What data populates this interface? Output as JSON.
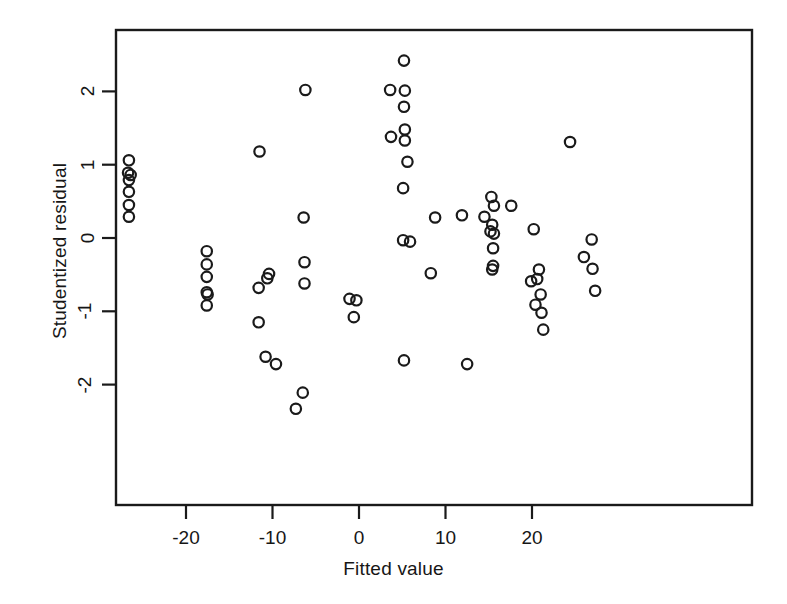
{
  "figure": {
    "background": "#ffffff",
    "ink_color": "#1a1a1a",
    "marker": "open-circle"
  },
  "chart_data": {
    "type": "scatter",
    "title": "",
    "xlabel": "Fitted value",
    "ylabel": "Studentized residual",
    "xlim": [
      -28.1,
      -28.1
    ],
    "x_axis_range": [
      -28.1,
      45.4
    ],
    "ylim": [
      -2.5,
      2.7
    ],
    "xticks": [
      -20,
      -10,
      0,
      10,
      20
    ],
    "xtick_labels": [
      "-20",
      "-10",
      "0",
      "10",
      "20"
    ],
    "yticks": [
      -2,
      -1,
      0,
      1,
      2
    ],
    "ytick_labels": [
      "-2",
      "-1",
      "0",
      "1",
      "2"
    ],
    "grid": false,
    "legend": null,
    "marker_style": "open circle",
    "n_points": 73,
    "points": [
      {
        "x": -26.6,
        "y": 1.06
      },
      {
        "x": -26.7,
        "y": 0.89
      },
      {
        "x": -26.4,
        "y": 0.86
      },
      {
        "x": -26.6,
        "y": 0.79
      },
      {
        "x": -26.6,
        "y": 0.63
      },
      {
        "x": -26.6,
        "y": 0.45
      },
      {
        "x": -26.6,
        "y": 0.29
      },
      {
        "x": -17.6,
        "y": -0.18
      },
      {
        "x": -17.6,
        "y": -0.36
      },
      {
        "x": -17.6,
        "y": -0.53
      },
      {
        "x": -17.6,
        "y": -0.74
      },
      {
        "x": -17.5,
        "y": -0.77
      },
      {
        "x": -17.6,
        "y": -0.92
      },
      {
        "x": -11.5,
        "y": 1.18
      },
      {
        "x": -11.6,
        "y": -0.68
      },
      {
        "x": -11.6,
        "y": -1.15
      },
      {
        "x": -10.6,
        "y": -0.55
      },
      {
        "x": -10.4,
        "y": -0.49
      },
      {
        "x": -10.8,
        "y": -1.62
      },
      {
        "x": -9.6,
        "y": -1.72
      },
      {
        "x": -7.3,
        "y": -2.33
      },
      {
        "x": -6.2,
        "y": 2.02
      },
      {
        "x": -6.4,
        "y": 0.28
      },
      {
        "x": -6.3,
        "y": -0.33
      },
      {
        "x": -6.3,
        "y": -0.62
      },
      {
        "x": -6.5,
        "y": -2.11
      },
      {
        "x": -1.1,
        "y": -0.83
      },
      {
        "x": -0.3,
        "y": -0.85
      },
      {
        "x": -0.6,
        "y": -1.08
      },
      {
        "x": 3.6,
        "y": 2.02
      },
      {
        "x": 3.7,
        "y": 1.38
      },
      {
        "x": 5.2,
        "y": 2.42
      },
      {
        "x": 5.3,
        "y": 2.01
      },
      {
        "x": 5.2,
        "y": 1.79
      },
      {
        "x": 5.3,
        "y": 1.48
      },
      {
        "x": 5.3,
        "y": 1.33
      },
      {
        "x": 5.6,
        "y": 1.04
      },
      {
        "x": 5.1,
        "y": 0.68
      },
      {
        "x": 5.1,
        "y": -0.03
      },
      {
        "x": 5.9,
        "y": -0.05
      },
      {
        "x": 5.2,
        "y": -1.67
      },
      {
        "x": 8.8,
        "y": 0.28
      },
      {
        "x": 8.3,
        "y": -0.48
      },
      {
        "x": 11.9,
        "y": 0.31
      },
      {
        "x": 12.5,
        "y": -1.72
      },
      {
        "x": 14.5,
        "y": 0.29
      },
      {
        "x": 15.3,
        "y": 0.56
      },
      {
        "x": 15.6,
        "y": 0.44
      },
      {
        "x": 15.4,
        "y": 0.18
      },
      {
        "x": 15.2,
        "y": 0.09
      },
      {
        "x": 15.6,
        "y": 0.06
      },
      {
        "x": 15.5,
        "y": -0.14
      },
      {
        "x": 15.5,
        "y": -0.38
      },
      {
        "x": 15.4,
        "y": -0.43
      },
      {
        "x": 17.6,
        "y": 0.44
      },
      {
        "x": 20.2,
        "y": 0.12
      },
      {
        "x": 20.8,
        "y": -0.43
      },
      {
        "x": 19.9,
        "y": -0.59
      },
      {
        "x": 20.6,
        "y": -0.56
      },
      {
        "x": 21.0,
        "y": -0.77
      },
      {
        "x": 20.4,
        "y": -0.91
      },
      {
        "x": 21.1,
        "y": -1.02
      },
      {
        "x": 21.3,
        "y": -1.25
      },
      {
        "x": 24.4,
        "y": 1.31
      },
      {
        "x": 26.9,
        "y": -0.02
      },
      {
        "x": 26.0,
        "y": -0.26
      },
      {
        "x": 27.0,
        "y": -0.42
      },
      {
        "x": 27.3,
        "y": -0.72
      }
    ]
  }
}
